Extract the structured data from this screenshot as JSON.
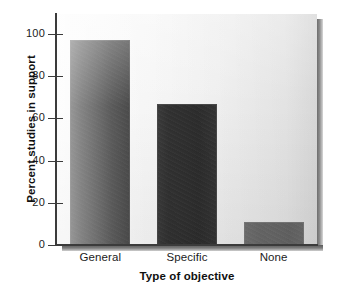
{
  "chart_data": {
    "type": "bar",
    "title": "",
    "subtitle": "",
    "categories": [
      "General",
      "Specific",
      "None"
    ],
    "values": [
      97,
      67,
      11
    ],
    "xlabel": "Type of objective",
    "ylabel": "Percent studies in support",
    "ylim": [
      0,
      100
    ],
    "yticks": [
      0,
      20,
      40,
      60,
      80,
      100
    ],
    "ytick_labels": [
      "0",
      "20",
      "40",
      "60",
      "80",
      "100"
    ],
    "grid": false,
    "legend": null,
    "bar_colors": [
      "#2f2f2f",
      "#2f2f2f",
      "#6a6a6a"
    ],
    "plot_background": "#f2f2f2",
    "axis_color": "#3b3b3b"
  },
  "axes": {
    "y_title": "Percent studies in support",
    "x_title": "Type of objective"
  },
  "ticks": {
    "y": [
      {
        "label": "100",
        "value": 100
      },
      {
        "label": "80",
        "value": 80
      },
      {
        "label": "60",
        "value": 60
      },
      {
        "label": "40",
        "value": 40
      },
      {
        "label": "20",
        "value": 20
      },
      {
        "label": "0",
        "value": 0
      }
    ],
    "x": [
      {
        "label": "General"
      },
      {
        "label": "Specific"
      },
      {
        "label": "None"
      }
    ]
  },
  "bars": [
    {
      "label": "General",
      "value": 97,
      "color": "#2f2f2f"
    },
    {
      "label": "Specific",
      "value": 67,
      "color": "#2f2f2f"
    },
    {
      "label": "None",
      "value": 11,
      "color": "#6a6a6a"
    }
  ]
}
